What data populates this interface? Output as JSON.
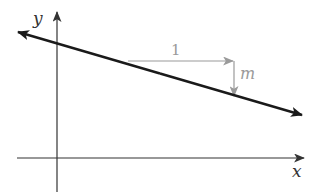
{
  "diagram": {
    "axes": {
      "x_label": "x",
      "y_label": "y",
      "axis_color": "#333333"
    },
    "line": {
      "description": "decreasing line with arrows at both ends",
      "color": "#1a1a1a",
      "slope_sign": "negative"
    },
    "run_arrow": {
      "label": "1",
      "direction": "right",
      "color": "#999999"
    },
    "rise_arrow": {
      "label": "m",
      "direction": "down",
      "color": "#999999"
    }
  }
}
